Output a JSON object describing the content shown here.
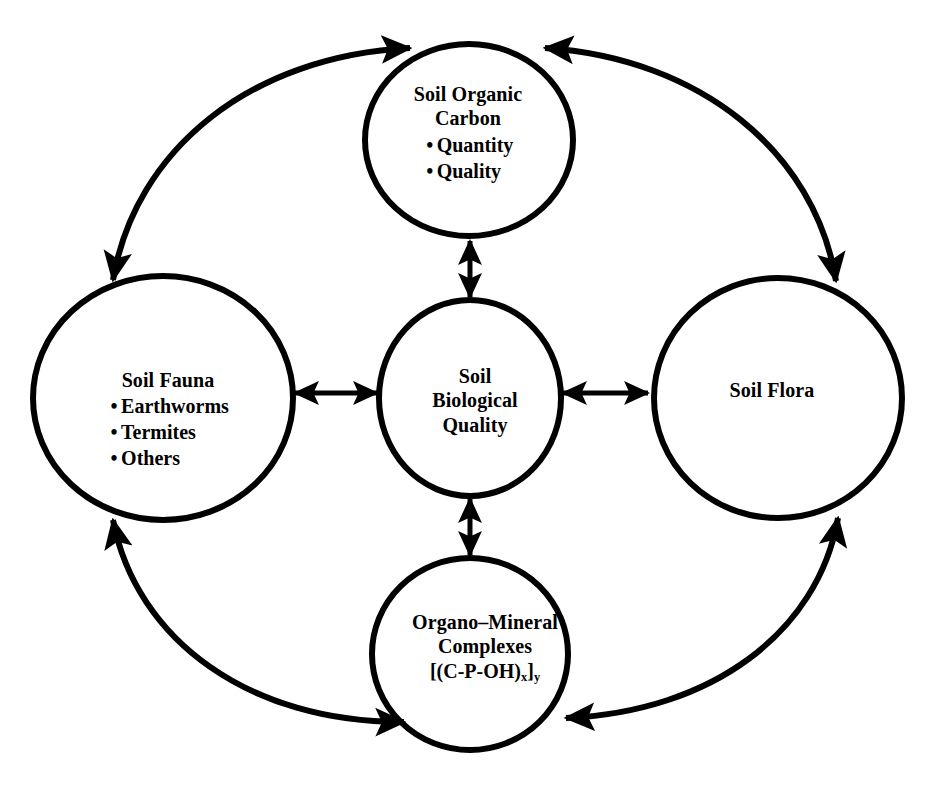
{
  "diagram": {
    "type": "conceptual-cycle-diagram",
    "stroke_color": "#000000",
    "background_color": "#ffffff",
    "nodes": {
      "soil_organic_carbon": {
        "title_line1": "Soil Organic",
        "title_line2": "Carbon",
        "bullets": [
          "Quantity",
          "Quality"
        ],
        "bullet_marker": "•"
      },
      "soil_fauna": {
        "title": "Soil Fauna",
        "bullets": [
          "Earthworms",
          "Termites",
          "Others"
        ],
        "bullet_marker": "•"
      },
      "soil_biological_quality": {
        "title_line1": "Soil",
        "title_line2": "Biological",
        "title_line3": "Quality"
      },
      "soil_flora": {
        "title": "Soil Flora"
      },
      "organo_mineral_complexes": {
        "title_line1": "Organo–Mineral",
        "title_line2": "Complexes",
        "formula_prefix": "[(C-P-OH)",
        "formula_sub1": "x",
        "formula_mid": "]",
        "formula_sub2": "y"
      }
    },
    "connectors": {
      "center_to_top": "double-headed-vertical-arrow",
      "center_to_bottom": "double-headed-vertical-arrow",
      "center_to_left": "double-headed-horizontal-arrow",
      "center_to_right": "double-headed-horizontal-arrow",
      "outer_top_left_arc": "double-headed-curved-arrow",
      "outer_top_right_arc": "double-headed-curved-arrow",
      "outer_bottom_left_arc": "double-headed-curved-arrow",
      "outer_bottom_right_arc": "double-headed-curved-arrow"
    }
  }
}
